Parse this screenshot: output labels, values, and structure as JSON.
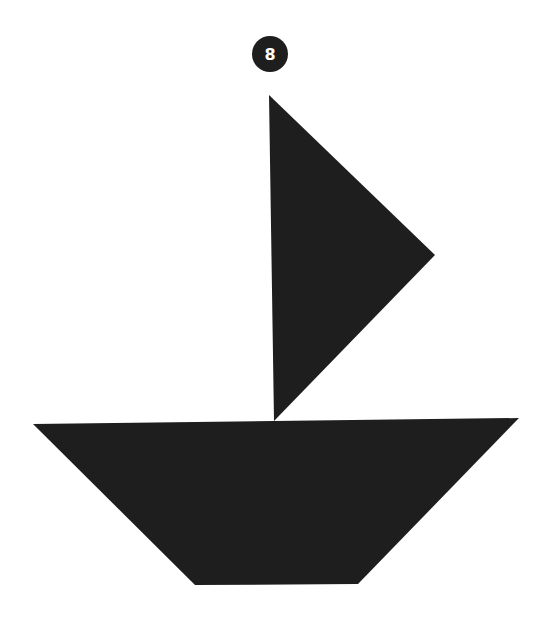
{
  "puzzle": {
    "number": "8",
    "shape_name": "sailboat",
    "fill_color": "#1e1e1e",
    "background_color": "#ffffff",
    "pieces": [
      {
        "name": "sail",
        "points": "269,95 435,255 274,421"
      },
      {
        "name": "hull",
        "points": "33,424 519,418 358,584 195,585"
      }
    ]
  }
}
